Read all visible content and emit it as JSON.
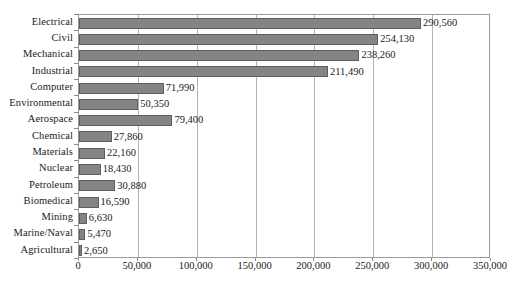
{
  "chart_data": {
    "type": "bar",
    "orientation": "horizontal",
    "title": "",
    "xlabel": "",
    "ylabel": "",
    "xlim": [
      0,
      350000
    ],
    "xticks": [
      0,
      50000,
      100000,
      150000,
      200000,
      250000,
      300000,
      350000
    ],
    "xtick_labels": [
      "0",
      "50,000",
      "100,000",
      "150,000",
      "200,000",
      "250,000",
      "300,000",
      "350,000"
    ],
    "grid": true,
    "legend": "none",
    "categories": [
      "Electrical",
      "Civil",
      "Mechanical",
      "Industrial",
      "Computer",
      "Environmental",
      "Aerospace",
      "Chemical",
      "Materials",
      "Nuclear",
      "Petroleum",
      "Biomedical",
      "Mining",
      "Marine/Naval",
      "Agricultural"
    ],
    "values": [
      290560,
      254130,
      238260,
      211490,
      71990,
      50350,
      79400,
      27860,
      22160,
      18430,
      30880,
      16590,
      6630,
      5470,
      2650
    ],
    "value_labels": [
      "290,560",
      "254,130",
      "238,260",
      "211,490",
      "71,990",
      "50,350",
      "79,400",
      "27,860",
      "22,160",
      "18,430",
      "30,880",
      "16,590",
      "6,630",
      "5,470",
      "2,650"
    ],
    "colors": {
      "bar_fill": "#848484",
      "bar_border": "#5e5e5e",
      "gridline": "#b5b5b5",
      "frame": "#9a9a9a",
      "background": "#ffffff",
      "text": "#1a1a1a"
    }
  }
}
